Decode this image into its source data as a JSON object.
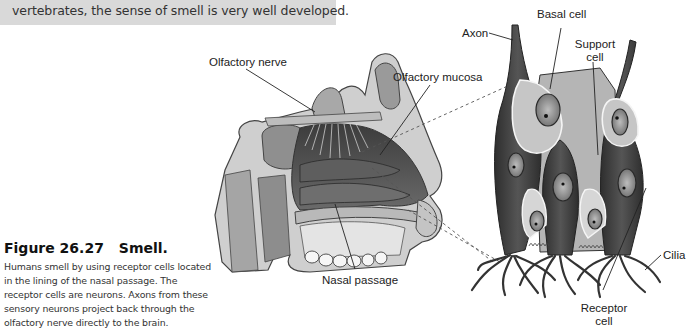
{
  "banner": {
    "text": "vertebrates, the sense of smell is very well developed."
  },
  "caption": {
    "figure_number": "Figure 26.27",
    "figure_title": "Smell.",
    "body": "Humans smell by using receptor cells located in the lining of the nasal passage. The receptor cells are neurons. Axons from these sensory neurons project back through the olfactory nerve directly to the brain."
  },
  "labels": {
    "olfactory_nerve": "Olfactory nerve",
    "olfactory_mucosa": "Olfactory mucosa",
    "nasal_passage": "Nasal passage",
    "axon": "Axon",
    "basal_cell": "Basal cell",
    "support_cell_line1": "Support",
    "support_cell_line2": "cell",
    "cilia": "Cilia",
    "receptor_cell_line1": "Receptor",
    "receptor_cell_line2": "cell"
  },
  "colors": {
    "banner_bg": "#d9d9d9",
    "dark_tissue": "#3a3a3a",
    "mid_tissue": "#8a8a8a",
    "light_tissue": "#d0d0d0"
  }
}
